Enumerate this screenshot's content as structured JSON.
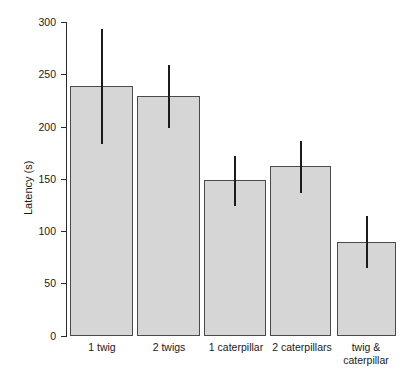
{
  "chart_data": {
    "type": "bar",
    "title": "",
    "xlabel": "",
    "ylabel": "Latency (s)",
    "ylim": [
      0,
      300
    ],
    "yticks": [
      0,
      50,
      100,
      150,
      200,
      250,
      300
    ],
    "ytick_labels": [
      "0",
      "50",
      "100",
      "150",
      "200",
      "250",
      "300"
    ],
    "grid": false,
    "legend": null,
    "categories": [
      "1 twig",
      "2 twigs",
      "1 caterpillar",
      "2 caterpillars",
      "twig &\ncaterpillar"
    ],
    "values": [
      239,
      229,
      149,
      162,
      90
    ],
    "error_upper": [
      293,
      259,
      172,
      186,
      115
    ],
    "error_lower": [
      183,
      199,
      124,
      137,
      65
    ],
    "bar_fill_color": "#d6d6d6",
    "bar_border_color": "#4a4a4a",
    "errorbar_color": "#1c1c1c",
    "axis_color": "#2b2b2b"
  }
}
